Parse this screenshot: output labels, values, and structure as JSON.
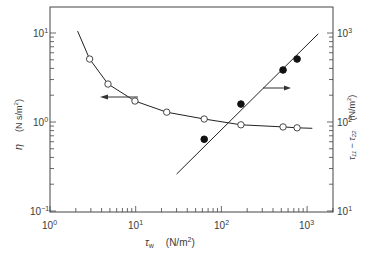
{
  "chart_data": {
    "type": "scatter",
    "title": "",
    "xlabel": "τw (N/m²)",
    "ylabel": "η (N s/m²)",
    "ylabel_right": "τ11 − τ22 (N/m²)",
    "x_scale": "log",
    "y_scale": "log",
    "xlim": [
      1,
      2000
    ],
    "ylim": [
      0.1,
      20
    ],
    "ylim_right": [
      10,
      2000
    ],
    "x_ticks": [
      "10^0",
      "10^1",
      "10^2",
      "10^3"
    ],
    "y_ticks": [
      "10^-1",
      "10^0",
      "10^1"
    ],
    "y_ticks_right": [
      "10^1",
      "10^2",
      "10^3"
    ],
    "grid": false,
    "series": [
      {
        "name": "η (viscosity)",
        "axis": "left",
        "marker": "open-circle",
        "x": [
          2.9,
          4.75,
          9.8,
          23,
          63,
          169,
          524,
          764
        ],
        "values": [
          5.1,
          2.67,
          1.72,
          1.29,
          1.08,
          0.93,
          0.88,
          0.86
        ],
        "fit_curve": true,
        "arrow_direction": "left"
      },
      {
        "name": "τ11 − τ22 (normal stress difference)",
        "axis": "right",
        "marker": "filled-circle",
        "x": [
          63,
          169,
          524,
          764
        ],
        "values": [
          64,
          159,
          384,
          510
        ],
        "fit_line": true,
        "arrow_direction": "right"
      }
    ]
  },
  "labels": {
    "x_axis_symbol": "τ",
    "x_axis_sub": "w",
    "x_axis_units": "(N/m",
    "x_axis_units_sup": "2",
    "x_axis_units_end": ")",
    "y_left_symbol": "η",
    "y_left_units": "(N s/m",
    "y_left_units_sup": "2",
    "y_left_units_end": ")",
    "y_right_text": "τ₁₁ − τ₂₂",
    "y_right_units": "(N/m",
    "y_right_units_sup": "2",
    "y_right_units_end": ")",
    "x_tick_base": "10",
    "x_tick_exps": [
      "0",
      "1",
      "2",
      "3"
    ],
    "yl_tick_exps": [
      "1",
      "0",
      "−1"
    ],
    "yr_tick_exps": [
      "3",
      "2",
      "1"
    ]
  }
}
